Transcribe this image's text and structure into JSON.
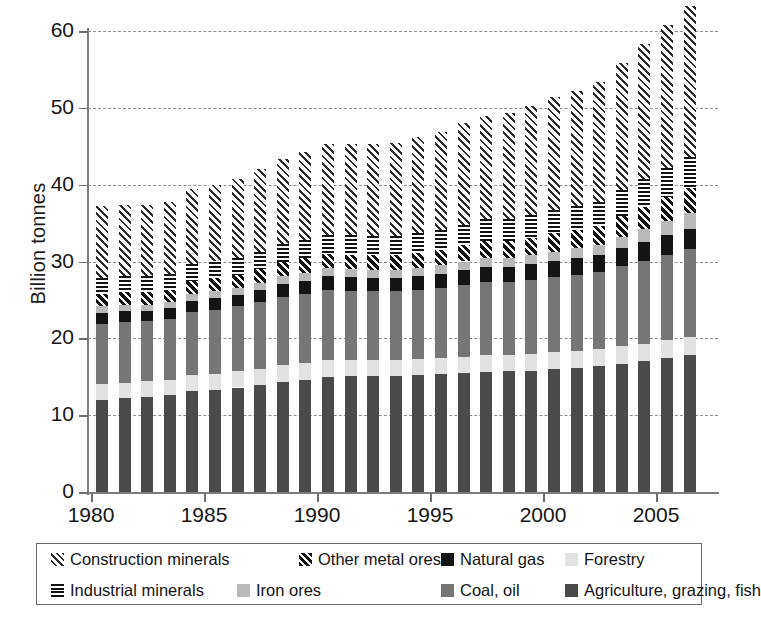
{
  "chart_data": {
    "type": "bar",
    "stacked": true,
    "title": "",
    "xlabel": "",
    "ylabel": "Billion tonnes",
    "ylim": [
      0,
      60
    ],
    "yticks": [
      0,
      10,
      20,
      30,
      40,
      50,
      60
    ],
    "xticks": [
      1980,
      1985,
      1990,
      1995,
      2000,
      2005
    ],
    "grid": "horizontal-dashed",
    "legend_position": "bottom",
    "categories": [
      1980,
      1981,
      1982,
      1983,
      1984,
      1985,
      1986,
      1987,
      1988,
      1989,
      1990,
      1991,
      1992,
      1993,
      1994,
      1995,
      1996,
      1997,
      1998,
      1999,
      2000,
      2001,
      2002,
      2003,
      2004,
      2005,
      2006
    ],
    "series": [
      {
        "name": "Agriculture, grazing, fish",
        "key": "agri",
        "color": "#4a4a4a",
        "pattern": "solid",
        "values": [
          12.0,
          12.2,
          12.4,
          12.6,
          13.1,
          13.3,
          13.6,
          13.9,
          14.3,
          14.6,
          15.0,
          15.1,
          15.1,
          15.1,
          15.2,
          15.3,
          15.5,
          15.6,
          15.7,
          15.8,
          16.0,
          16.2,
          16.4,
          16.7,
          17.0,
          17.4,
          17.8
        ]
      },
      {
        "name": "Forestry",
        "key": "forestry",
        "color": "#e2e2e2",
        "pattern": "solid",
        "values": [
          2.0,
          2.0,
          2.0,
          2.0,
          2.1,
          2.1,
          2.1,
          2.1,
          2.2,
          2.2,
          2.2,
          2.1,
          2.1,
          2.1,
          2.1,
          2.1,
          2.1,
          2.2,
          2.1,
          2.2,
          2.2,
          2.2,
          2.2,
          2.3,
          2.3,
          2.4,
          2.4
        ]
      },
      {
        "name": "Coal, oil",
        "key": "coal_oil",
        "color": "#767676",
        "pattern": "solid",
        "values": [
          7.9,
          7.9,
          7.8,
          7.9,
          8.2,
          8.3,
          8.5,
          8.7,
          8.9,
          9.0,
          9.1,
          9.0,
          8.9,
          8.9,
          9.0,
          9.1,
          9.3,
          9.5,
          9.5,
          9.6,
          9.8,
          9.9,
          10.0,
          10.4,
          10.8,
          11.1,
          11.4
        ]
      },
      {
        "name": "Natural gas",
        "key": "natural_gas",
        "color": "#141414",
        "pattern": "solid",
        "values": [
          1.4,
          1.4,
          1.4,
          1.4,
          1.5,
          1.5,
          1.5,
          1.6,
          1.7,
          1.7,
          1.8,
          1.8,
          1.8,
          1.8,
          1.8,
          1.9,
          2.0,
          2.0,
          2.0,
          2.1,
          2.1,
          2.2,
          2.2,
          2.3,
          2.4,
          2.5,
          2.6
        ]
      },
      {
        "name": "Iron ores",
        "key": "iron_ores",
        "color": "#b9b9b9",
        "pattern": "solid",
        "values": [
          0.9,
          0.9,
          0.8,
          0.8,
          0.9,
          0.9,
          0.9,
          0.9,
          1.0,
          1.0,
          1.0,
          1.0,
          1.0,
          1.0,
          1.0,
          1.1,
          1.1,
          1.2,
          1.2,
          1.1,
          1.2,
          1.2,
          1.3,
          1.5,
          1.7,
          1.9,
          2.1
        ]
      },
      {
        "name": "Other metal ores",
        "key": "other_metal_ores",
        "color": "#111111",
        "pattern": "diagonal-white-on-black",
        "values": [
          1.6,
          1.6,
          1.6,
          1.6,
          1.7,
          1.7,
          1.7,
          1.8,
          1.8,
          1.9,
          1.9,
          1.9,
          1.9,
          1.9,
          2.0,
          2.0,
          2.1,
          2.2,
          2.2,
          2.3,
          2.4,
          2.4,
          2.5,
          2.7,
          2.9,
          3.1,
          3.3
        ]
      },
      {
        "name": "Industrial minerals",
        "key": "industrial_minerals",
        "color": "#111111",
        "pattern": "horizontal-stripes",
        "values": [
          2.1,
          2.1,
          2.1,
          2.1,
          2.2,
          2.2,
          2.2,
          2.3,
          2.4,
          2.4,
          2.5,
          2.5,
          2.5,
          2.5,
          2.6,
          2.6,
          2.7,
          2.8,
          2.8,
          2.9,
          3.0,
          3.1,
          3.2,
          3.4,
          3.6,
          3.8,
          4.0
        ]
      },
      {
        "name": "Construction minerals",
        "key": "construction_minerals",
        "color": "#2b2b2b",
        "pattern": "diagonal-hatch",
        "values": [
          9.3,
          9.3,
          9.2,
          9.4,
          9.8,
          9.9,
          10.3,
          10.7,
          11.0,
          11.4,
          11.8,
          11.9,
          12.0,
          12.1,
          12.5,
          12.7,
          13.2,
          13.5,
          13.8,
          14.2,
          14.7,
          15.0,
          15.6,
          16.6,
          17.6,
          18.6,
          19.6
        ]
      }
    ],
    "totals": [
      37.2,
      37.4,
      37.3,
      37.8,
      39.5,
      39.9,
      40.8,
      42.0,
      43.3,
      44.2,
      45.3,
      45.3,
      45.3,
      45.4,
      46.2,
      46.8,
      48.0,
      49.0,
      49.3,
      50.2,
      51.4,
      52.2,
      53.4,
      55.9,
      58.3,
      60.8,
      63.2
    ],
    "legend": [
      {
        "label": "Construction minerals",
        "key": "construction_minerals"
      },
      {
        "label": "Other metal ores",
        "key": "other_metal_ores"
      },
      {
        "label": "Natural gas",
        "key": "natural_gas"
      },
      {
        "label": "Forestry",
        "key": "forestry"
      },
      {
        "label": "Industrial minerals",
        "key": "industrial_minerals"
      },
      {
        "label": "Iron ores",
        "key": "iron_ores"
      },
      {
        "label": "Coal, oil",
        "key": "coal_oil"
      },
      {
        "label": "Agriculture, grazing, fish",
        "key": "agri"
      }
    ]
  }
}
